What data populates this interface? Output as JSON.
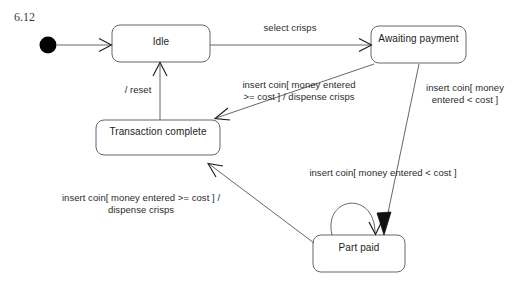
{
  "figure": {
    "number": "6.12"
  },
  "colors": {
    "stroke": "#555555",
    "text": "#1c1c1c",
    "initial_node": "#000000",
    "background": "#ffffff"
  },
  "states": [
    {
      "id": "idle",
      "label": "Idle"
    },
    {
      "id": "awaiting_payment",
      "label": "Awaiting payment"
    },
    {
      "id": "transaction_complete",
      "label": "Transaction complete"
    },
    {
      "id": "part_paid",
      "label": "Part paid"
    }
  ],
  "initial_node": {
    "name": "initial-state"
  },
  "transitions": [
    {
      "id": "start_to_idle",
      "from": "initial",
      "to": "idle",
      "label": ""
    },
    {
      "id": "idle_to_awaiting",
      "from": "idle",
      "to": "awaiting_payment",
      "label": "select crisps"
    },
    {
      "id": "awaiting_to_complete",
      "from": "awaiting_payment",
      "to": "transaction_complete",
      "label": "insert coin[ money entered\n>= cost ] / dispense crisps"
    },
    {
      "id": "awaiting_to_partpaid",
      "from": "awaiting_payment",
      "to": "part_paid",
      "label": "insert coin[ money\nentered < cost ]"
    },
    {
      "id": "partpaid_self",
      "from": "part_paid",
      "to": "part_paid",
      "label": "insert coin[ money entered < cost ]"
    },
    {
      "id": "partpaid_to_complete",
      "from": "part_paid",
      "to": "transaction_complete",
      "label": "insert coin[ money entered >= cost ] /\ndispense crisps"
    },
    {
      "id": "complete_to_idle",
      "from": "transaction_complete",
      "to": "idle",
      "label": "/ reset"
    }
  ]
}
